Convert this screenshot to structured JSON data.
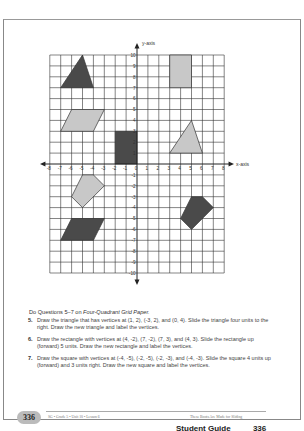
{
  "graph": {
    "y_axis_label": "y-axis",
    "x_axis_label": "x-axis",
    "x_ticks": [
      "-8",
      "-7",
      "-6",
      "-5",
      "-4",
      "-3",
      "-2",
      "-1",
      "0",
      "1",
      "2",
      "3",
      "4",
      "5",
      "6",
      "7",
      "8"
    ],
    "y_ticks_pos": [
      "1",
      "2",
      "3",
      "4",
      "5",
      "6",
      "7",
      "8",
      "9",
      "10"
    ],
    "y_ticks_neg": [
      "-1",
      "-2",
      "-3",
      "-4",
      "-5",
      "-6",
      "-7",
      "-8",
      "-9",
      "-10"
    ],
    "colors": {
      "dark": "#4a4a4a",
      "light": "#c8c8c8",
      "grid": "#333333"
    },
    "shapes": [
      {
        "name": "dark-triangle",
        "fill": "dark",
        "points": [
          [
            -7,
            7
          ],
          [
            -5,
            10
          ],
          [
            -4,
            7
          ]
        ]
      },
      {
        "name": "light-rectangle",
        "fill": "light",
        "points": [
          [
            3,
            7
          ],
          [
            5,
            7
          ],
          [
            5,
            10
          ],
          [
            3,
            10
          ]
        ]
      },
      {
        "name": "light-parallelogram",
        "fill": "light",
        "points": [
          [
            -7,
            3
          ],
          [
            -6,
            5
          ],
          [
            -3,
            5
          ],
          [
            -4,
            3
          ]
        ]
      },
      {
        "name": "dark-rectangle",
        "fill": "dark",
        "points": [
          [
            -2,
            0
          ],
          [
            0,
            0
          ],
          [
            0,
            3
          ],
          [
            -2,
            3
          ]
        ]
      },
      {
        "name": "light-triangle",
        "fill": "light",
        "points": [
          [
            3,
            1
          ],
          [
            5,
            4
          ],
          [
            6,
            1
          ]
        ]
      },
      {
        "name": "light-pentagon",
        "fill": "light",
        "points": [
          [
            -5,
            -1
          ],
          [
            -4,
            -1
          ],
          [
            -3,
            -2
          ],
          [
            -5,
            -4
          ],
          [
            -6,
            -3
          ]
        ]
      },
      {
        "name": "dark-pentagon",
        "fill": "dark",
        "points": [
          [
            5,
            -3
          ],
          [
            6,
            -3
          ],
          [
            7,
            -4
          ],
          [
            5,
            -6
          ],
          [
            4,
            -5
          ]
        ]
      },
      {
        "name": "dark-parallelogram",
        "fill": "dark",
        "points": [
          [
            -7,
            -7
          ],
          [
            -6,
            -5
          ],
          [
            -3,
            -5
          ],
          [
            -4,
            -7
          ]
        ]
      }
    ]
  },
  "intro": {
    "prefix": "Do Questions 5–7 on ",
    "italic": "Four-Quadrant Grid Paper."
  },
  "questions": [
    {
      "num": "5.",
      "text": "Draw the triangle that has vertices at (1, 2), (-3, 2), and (0, 4). Slide the triangle four units to the right. Draw the new triangle and label the vertices."
    },
    {
      "num": "6.",
      "text": "Draw the rectangle with vertices at (4, -2), (7, -2), (7, 3), and (4, 3). Slide the rectangle up (forward) 5 units. Draw the new rectangle and label the vertices."
    },
    {
      "num": "7.",
      "text": "Draw the square with vertices at (-4, -5), (-2, -5), (-2, -3), and (-4, -3). Slide the square 4 units up (forward) and 3 units right. Draw the new square and label the vertices."
    }
  ],
  "footer": {
    "page_number": "336",
    "left": "SG • Grade 5 • Unit 10 • Lesson 6",
    "right": "These Boots Are Made for Sliding"
  },
  "bottom_caption": "Student Guide          336"
}
